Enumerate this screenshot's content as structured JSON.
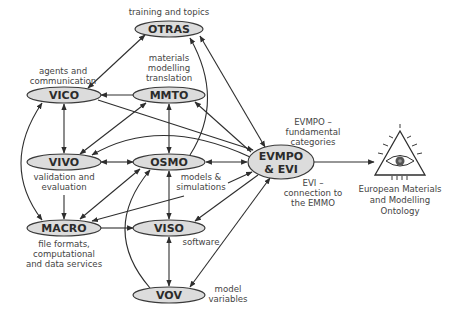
{
  "diagram": {
    "nodes": {
      "otras": {
        "label": "OTRAS",
        "caption": [
          "training and topics"
        ]
      },
      "vico": {
        "label": "VICO",
        "caption": [
          "agents and",
          "communication"
        ]
      },
      "mmto": {
        "label": "MMTO",
        "caption": [
          "materials",
          "modelling",
          "translation"
        ]
      },
      "vivo": {
        "label": "VIVO",
        "caption": [
          "validation and",
          "evaluation"
        ]
      },
      "osmo": {
        "label": "OSMO",
        "caption": [
          "models &",
          "simulations"
        ]
      },
      "evmpo": {
        "label_line1": "EVMPO",
        "label_line2": "& EVI",
        "caption_top": [
          "EVMPO –",
          "fundamental",
          "categories"
        ],
        "caption_bottom": [
          "EVI –",
          "connection to",
          "the EMMO"
        ]
      },
      "macro": {
        "label": "MACRO",
        "caption": [
          "file formats,",
          "computational",
          "and data services"
        ]
      },
      "viso": {
        "label": "VISO",
        "caption": [
          "software"
        ]
      },
      "vov": {
        "label": "VOV",
        "caption": [
          "model",
          "variables"
        ]
      },
      "emmo": {
        "icon": "eye-in-triangle-icon",
        "caption": [
          "European Materials",
          "and Modelling",
          "Ontology"
        ]
      }
    },
    "colors": {
      "node_fill": "#dcdcdc",
      "stroke": "#2e2e2e",
      "text": "#444444"
    }
  }
}
